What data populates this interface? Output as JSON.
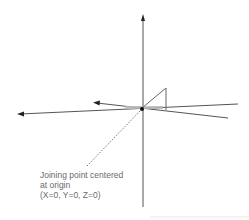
{
  "diagram": {
    "title": "",
    "origin": {
      "x": 142,
      "y": 108
    },
    "colors": {
      "axis": "#555555",
      "arrow": "#222222",
      "bar": "#b8b8b8",
      "leader": "#777777",
      "text": "#6a6a6a",
      "bottom_rule": "#e6e6e6"
    },
    "annotation": {
      "line1": "Joining point centered",
      "line2": "at origin",
      "line3": "(X=0, Y=0, Z=0)"
    },
    "axes": [
      {
        "name": "vertical-axis",
        "direction": "up",
        "has_arrow": true
      },
      {
        "name": "horizontal-axis",
        "direction": "left",
        "has_arrow": true
      },
      {
        "name": "depth-axis",
        "direction": "upper-left",
        "has_arrow": true
      },
      {
        "name": "right-extension-upper",
        "has_arrow": false
      },
      {
        "name": "right-extension-lower",
        "has_arrow": false
      }
    ]
  }
}
